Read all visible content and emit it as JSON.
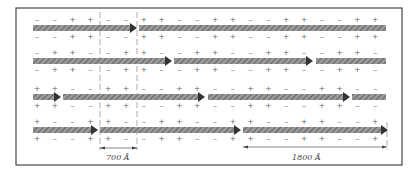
{
  "figure": {
    "frame": {
      "x": 16,
      "y": 8,
      "w": 386,
      "h": 157
    },
    "colors": {
      "arrow_fill": "#8a8a8a",
      "arrow_head": "#333333",
      "stripe": "#5a5a5a",
      "frame": "#555555",
      "sign": "#666666",
      "guide": "#777777"
    },
    "rows": [
      {
        "y": 28,
        "segments": [
          [
            33,
            137,
            true
          ],
          [
            139,
            386,
            false
          ]
        ],
        "sign_offset": 0
      },
      {
        "y": 61,
        "segments": [
          [
            33,
            172,
            true
          ],
          [
            174,
            313,
            true
          ],
          [
            316,
            386,
            false
          ]
        ],
        "sign_offset": 1
      },
      {
        "y": 97,
        "segments": [
          [
            33,
            61,
            true
          ],
          [
            63,
            205,
            true
          ],
          [
            208,
            350,
            true
          ],
          [
            352,
            386,
            false
          ]
        ],
        "sign_offset": 2
      },
      {
        "y": 130,
        "segments": [
          [
            33,
            98,
            true
          ],
          [
            100,
            241,
            true
          ],
          [
            243,
            388,
            true
          ]
        ],
        "sign_offset": 3
      }
    ],
    "signs": {
      "start_x": 37,
      "step": 17.8,
      "count": 20
    },
    "guides": [
      {
        "x": 100
      },
      {
        "x": 137
      }
    ],
    "dimensions": [
      {
        "label": "700 Å",
        "x1": 100,
        "x2": 137,
        "y": 148,
        "label_x": 106,
        "label_y": 160
      },
      {
        "label": "1800 Å",
        "x1": 243,
        "x2": 387,
        "y": 147,
        "label_x": 292,
        "label_y": 160
      }
    ]
  }
}
